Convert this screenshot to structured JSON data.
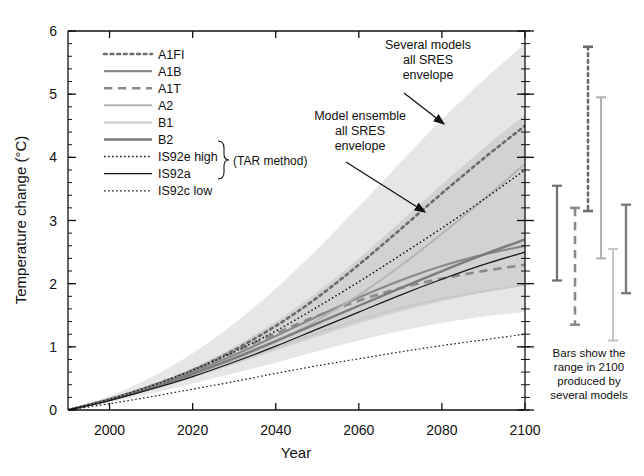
{
  "chart_data": {
    "type": "line",
    "title": "",
    "xlabel": "Year",
    "ylabel": "Temperature change (°C)",
    "xlim": [
      1990,
      2100
    ],
    "ylim": [
      0,
      6
    ],
    "xticks": [
      2000,
      2020,
      2040,
      2060,
      2080,
      2100
    ],
    "xtick_labels": [
      "2000",
      "2020",
      "2040",
      "2060",
      "2080",
      "2100"
    ],
    "yticks": [
      0,
      1,
      2,
      3,
      4,
      5,
      6
    ],
    "ytick_labels": [
      "0",
      "1",
      "2",
      "3",
      "4",
      "5",
      "6"
    ],
    "minor_tick_interval": 0.2,
    "grid": false,
    "legend_position": "upper-left-inside",
    "x": [
      1990,
      2000,
      2010,
      2020,
      2030,
      2040,
      2050,
      2060,
      2070,
      2080,
      2090,
      2100
    ],
    "series": [
      {
        "name": "A1FI",
        "style": "dotted",
        "color": "#6b6b6b",
        "width": 2.6,
        "values": [
          0.0,
          0.17,
          0.38,
          0.63,
          0.95,
          1.33,
          1.78,
          2.3,
          2.86,
          3.43,
          3.98,
          4.5
        ]
      },
      {
        "name": "A1B",
        "style": "solid",
        "color": "#8a8a8a",
        "width": 2.2,
        "values": [
          0.0,
          0.17,
          0.37,
          0.6,
          0.87,
          1.17,
          1.48,
          1.78,
          2.05,
          2.28,
          2.46,
          2.6
        ]
      },
      {
        "name": "A1T",
        "style": "dashed",
        "color": "#8a8a8a",
        "width": 2.6,
        "values": [
          0.0,
          0.17,
          0.38,
          0.63,
          0.92,
          1.21,
          1.49,
          1.73,
          1.93,
          2.08,
          2.2,
          2.3
        ]
      },
      {
        "name": "A2",
        "style": "solid",
        "color": "#b5b5b5",
        "width": 2.0,
        "values": [
          0.0,
          0.16,
          0.34,
          0.55,
          0.8,
          1.08,
          1.42,
          1.82,
          2.28,
          2.79,
          3.33,
          3.9
        ]
      },
      {
        "name": "B1",
        "style": "solid",
        "color": "#c9c9c9",
        "width": 2.0,
        "values": [
          0.0,
          0.16,
          0.34,
          0.54,
          0.76,
          0.99,
          1.22,
          1.43,
          1.61,
          1.76,
          1.88,
          1.98
        ]
      },
      {
        "name": "B2",
        "style": "solid",
        "color": "#7c7c7c",
        "width": 2.4,
        "values": [
          0.0,
          0.16,
          0.35,
          0.57,
          0.82,
          1.09,
          1.37,
          1.65,
          1.93,
          2.2,
          2.46,
          2.7
        ]
      },
      {
        "name": "IS92e high",
        "style": "dotted",
        "color": "#1a1a1a",
        "width": 1.5,
        "values": [
          0.0,
          0.17,
          0.38,
          0.63,
          0.92,
          1.25,
          1.63,
          2.03,
          2.45,
          2.88,
          3.33,
          3.8
        ]
      },
      {
        "name": "IS92a",
        "style": "solid",
        "color": "#1a1a1a",
        "width": 1.3,
        "values": [
          0.0,
          0.15,
          0.33,
          0.53,
          0.76,
          1.01,
          1.28,
          1.55,
          1.82,
          2.07,
          2.3,
          2.5
        ]
      },
      {
        "name": "IS92c low",
        "style": "dotted",
        "color": "#1a1a1a",
        "width": 1.2,
        "values": [
          0.0,
          0.1,
          0.21,
          0.33,
          0.45,
          0.58,
          0.7,
          0.81,
          0.92,
          1.02,
          1.11,
          1.2
        ]
      }
    ],
    "bands": [
      {
        "name": "Several models all SRES envelope",
        "fill": "#e6e6e6",
        "upper": [
          0.0,
          0.22,
          0.52,
          0.9,
          1.37,
          1.92,
          2.55,
          3.22,
          3.92,
          4.6,
          5.22,
          5.8
        ],
        "lower": [
          0.0,
          0.12,
          0.26,
          0.42,
          0.58,
          0.75,
          0.93,
          1.1,
          1.25,
          1.38,
          1.48,
          1.55
        ]
      },
      {
        "name": "Model ensemble all SRES envelope",
        "fill": "#d2d2d2",
        "upper": [
          0.0,
          0.18,
          0.4,
          0.66,
          1.0,
          1.4,
          1.87,
          2.4,
          2.98,
          3.57,
          4.14,
          4.68
        ],
        "lower": [
          0.0,
          0.15,
          0.32,
          0.51,
          0.72,
          0.94,
          1.16,
          1.37,
          1.56,
          1.72,
          1.86,
          1.98
        ]
      }
    ],
    "range_bars": {
      "note": "Bars show the range in 2100 produced by several models",
      "bars": [
        {
          "name": "all-models-range",
          "style": "solid",
          "color": "#6e6e6e",
          "width": 2.2,
          "low": 2.05,
          "high": 3.55
        },
        {
          "name": "A1T-range",
          "style": "dashed",
          "color": "#8a8a8a",
          "width": 2.6,
          "low": 1.35,
          "high": 3.2
        },
        {
          "name": "A1FI-range",
          "style": "dotted",
          "color": "#6b6b6b",
          "width": 2.6,
          "low": 3.15,
          "high": 5.75
        },
        {
          "name": "A2-range",
          "style": "solid",
          "color": "#b0b0b0",
          "width": 2.0,
          "low": 2.4,
          "high": 4.95
        },
        {
          "name": "B1-range",
          "style": "solid",
          "color": "#c4c4c4",
          "width": 2.0,
          "low": 1.1,
          "high": 2.55
        },
        {
          "name": "B2-range",
          "style": "solid",
          "color": "#7c7c7c",
          "width": 2.4,
          "low": 1.85,
          "high": 3.25
        }
      ]
    },
    "annotations": [
      {
        "name": "several-models-annotation",
        "lines": [
          "Several models",
          "all SRES",
          "envelope"
        ]
      },
      {
        "name": "model-ensemble-annotation",
        "lines": [
          "Model ensemble",
          "all SRES",
          "envelope"
        ]
      }
    ]
  },
  "legend": {
    "items": [
      {
        "label": "A1FI"
      },
      {
        "label": "A1B"
      },
      {
        "label": "A1T"
      },
      {
        "label": "A2"
      },
      {
        "label": "B1"
      },
      {
        "label": "B2"
      },
      {
        "label": "IS92e high"
      },
      {
        "label": "IS92a"
      },
      {
        "label": "IS92c low"
      }
    ],
    "bracket_label": "(TAR method)"
  },
  "caption": {
    "lines": [
      "Bars show the",
      "range in 2100",
      "produced by",
      "several models"
    ]
  }
}
